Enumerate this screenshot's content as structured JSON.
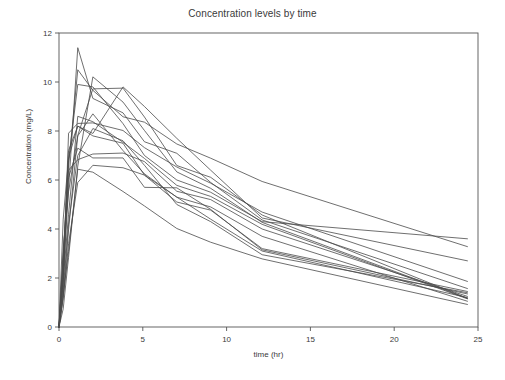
{
  "chart_data": {
    "type": "line",
    "title": "Concentration levels by time",
    "xlabel": "time (hr)",
    "ylabel": "Concentration (mg/L)",
    "xlim": [
      0,
      25
    ],
    "ylim": [
      0,
      12
    ],
    "xticks": [
      0,
      5,
      10,
      15,
      20,
      25
    ],
    "yticks": [
      0,
      2,
      4,
      6,
      8,
      10,
      12
    ],
    "grid": false,
    "legend": "none",
    "line_color": "#4a4a4a",
    "line_width": 0.8,
    "x": [
      0,
      0.25,
      0.57,
      1.12,
      2.02,
      3.82,
      5.1,
      7.03,
      9.05,
      12.12,
      24.37
    ],
    "series": [
      {
        "name": "Subject 1",
        "values": [
          0,
          2.84,
          6.57,
          10.5,
          9.66,
          8.58,
          8.36,
          7.47,
          6.89,
          5.94,
          3.28
        ]
      },
      {
        "name": "Subject 2",
        "values": [
          0,
          1.72,
          7.91,
          8.31,
          8.33,
          8.02,
          7.32,
          6.53,
          5.87,
          4.69,
          1.86
        ]
      },
      {
        "name": "Subject 3",
        "values": [
          0,
          4.4,
          6.9,
          8.2,
          7.8,
          7.5,
          6.2,
          5.3,
          4.9,
          3.7,
          1.05
        ]
      },
      {
        "name": "Subject 4",
        "values": [
          0,
          1.89,
          4.6,
          8.6,
          8.38,
          7.54,
          6.88,
          5.78,
          5.33,
          4.19,
          1.15
        ]
      },
      {
        "name": "Subject 5",
        "values": [
          0,
          2.02,
          5.63,
          11.4,
          9.33,
          8.74,
          7.56,
          7.09,
          5.9,
          4.37,
          1.57
        ]
      },
      {
        "name": "Subject 6",
        "values": [
          0,
          1.29,
          3.08,
          6.44,
          6.32,
          5.53,
          4.94,
          4.02,
          3.46,
          2.78,
          0.92
        ]
      },
      {
        "name": "Subject 7",
        "values": [
          0,
          0.74,
          2.84,
          6.57,
          10.21,
          9.18,
          8.02,
          6.33,
          5.66,
          4.27,
          1.17
        ]
      },
      {
        "name": "Subject 8",
        "values": [
          0,
          2.01,
          6.4,
          6.83,
          7.06,
          7.1,
          6.75,
          5.54,
          5.2,
          4.0,
          1.25
        ]
      },
      {
        "name": "Subject 9",
        "values": [
          0,
          1.25,
          3.96,
          7.82,
          9.72,
          9.75,
          8.57,
          6.59,
          6.11,
          4.57,
          1.17
        ]
      },
      {
        "name": "Subject 10",
        "values": [
          0,
          3.2,
          5.52,
          7.8,
          8.7,
          7.2,
          6.25,
          5.3,
          4.4,
          3.1,
          1.2
        ]
      },
      {
        "name": "Subject 11",
        "values": [
          0,
          2.3,
          6.1,
          7.3,
          6.9,
          6.9,
          5.7,
          5.68,
          4.8,
          3.15,
          1.35
        ]
      },
      {
        "name": "Subject 12",
        "values": [
          0,
          1.15,
          3.4,
          5.9,
          6.6,
          6.5,
          6.2,
          5.1,
          4.77,
          3.2,
          1.45
        ]
      },
      {
        "name": "Subject 13",
        "values": [
          0,
          2.6,
          7.2,
          8.2,
          7.9,
          9.8,
          9.0,
          7.7,
          6.4,
          4.45,
          2.7
        ]
      },
      {
        "name": "Subject 14",
        "values": [
          0,
          1.5,
          4.2,
          7.0,
          8.1,
          7.6,
          6.6,
          5.0,
          4.3,
          2.95,
          1.4
        ]
      },
      {
        "name": "Subject 15",
        "values": [
          0,
          2.9,
          6.8,
          9.9,
          9.8,
          8.3,
          7.0,
          6.0,
          5.5,
          4.3,
          3.6
        ]
      }
    ]
  }
}
